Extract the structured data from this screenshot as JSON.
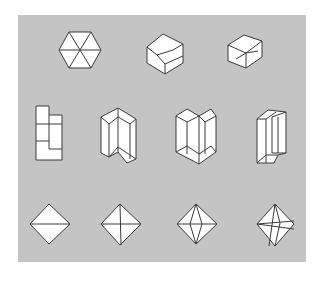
{
  "figure": {
    "background_color": "#c4c4c4",
    "line_color": "#3a3a3a",
    "face_color": "#ffffff",
    "rows": [
      {
        "row": "top",
        "items": [
          {
            "name": "hexagon-six-triangles",
            "description": "Regular hexagon divided into six triangles"
          },
          {
            "name": "cube-view-corner",
            "description": "Cube seen along body diagonal (hexagonal outline, inner Y edges)"
          },
          {
            "name": "cube-view-tilted",
            "description": "Cube seen slightly off body diagonal"
          }
        ]
      },
      {
        "row": "middle",
        "items": [
          {
            "name": "l-prism-front",
            "description": "L-shaped prism, orthographic front view"
          },
          {
            "name": "l-prism-oblique-1",
            "description": "L-shaped prism, oblique view"
          },
          {
            "name": "l-prism-oblique-2",
            "description": "L-shaped prism, V-notch view"
          },
          {
            "name": "l-prism-oblique-3",
            "description": "L-shaped prism, narrow oblique view"
          }
        ]
      },
      {
        "row": "bottom",
        "items": [
          {
            "name": "octahedron-edge-view",
            "description": "Octahedron with single horizontal edge"
          },
          {
            "name": "octahedron-vertex-view",
            "description": "Octahedron seen along vertex axis, cross inside"
          },
          {
            "name": "octahedron-rotated",
            "description": "Octahedron rotated, lens-shaped inner edges"
          },
          {
            "name": "octahedron-general",
            "description": "Octahedron in general orientation, crossing inner edges"
          }
        ]
      }
    ]
  }
}
